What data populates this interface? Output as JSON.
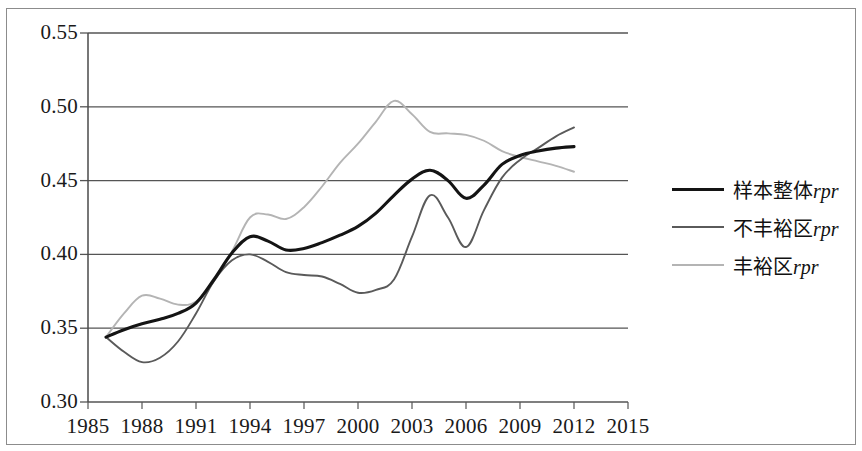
{
  "chart_data": {
    "type": "line",
    "title": "",
    "xlabel": "",
    "ylabel": "",
    "xlim": [
      1985,
      2015
    ],
    "ylim": [
      0.3,
      0.55
    ],
    "grid": true,
    "legend_position": "right",
    "x_ticks": [
      "1985",
      "1988",
      "1991",
      "1994",
      "1997",
      "2000",
      "2003",
      "2006",
      "2009",
      "2012",
      "2015"
    ],
    "y_ticks": [
      "0.55",
      "0.50",
      "0.45",
      "0.40",
      "0.35",
      "0.30"
    ],
    "x": [
      1986,
      1987,
      1988,
      1989,
      1990,
      1991,
      1992,
      1993,
      1994,
      1995,
      1996,
      1997,
      1998,
      1999,
      2000,
      2001,
      2002,
      2003,
      2004,
      2005,
      2006,
      2007,
      2008,
      2009,
      2010,
      2011,
      2012
    ],
    "series": [
      {
        "name": "样本整体rpr",
        "color": "#141414",
        "width": 3.1,
        "values": [
          0.344,
          0.349,
          0.353,
          0.356,
          0.36,
          0.367,
          0.383,
          0.401,
          0.412,
          0.409,
          0.403,
          0.404,
          0.408,
          0.413,
          0.419,
          0.428,
          0.44,
          0.451,
          0.457,
          0.45,
          0.438,
          0.447,
          0.461,
          0.467,
          0.47,
          0.472,
          0.473
        ]
      },
      {
        "name": "不丰裕区rpr",
        "color": "#5a5a5a",
        "width": 1.9,
        "values": [
          0.344,
          0.334,
          0.327,
          0.33,
          0.341,
          0.36,
          0.382,
          0.396,
          0.4,
          0.395,
          0.388,
          0.386,
          0.385,
          0.38,
          0.374,
          0.376,
          0.383,
          0.412,
          0.44,
          0.425,
          0.405,
          0.43,
          0.452,
          0.464,
          0.472,
          0.48,
          0.486
        ]
      },
      {
        "name": "丰裕区rpr",
        "color": "#b4b4b4",
        "width": 1.9,
        "values": [
          0.344,
          0.36,
          0.372,
          0.37,
          0.366,
          0.368,
          0.382,
          0.402,
          0.425,
          0.427,
          0.424,
          0.432,
          0.446,
          0.462,
          0.475,
          0.49,
          0.504,
          0.495,
          0.483,
          0.482,
          0.481,
          0.477,
          0.47,
          0.466,
          0.463,
          0.46,
          0.456
        ]
      }
    ]
  },
  "legend": {
    "items": [
      {
        "label_cn": "样本整体",
        "label_it": "rpr",
        "color": "#141414",
        "width": 3.4
      },
      {
        "label_cn": "不丰裕区",
        "label_it": "rpr",
        "color": "#5a5a5a",
        "width": 2.0
      },
      {
        "label_cn": "丰裕区",
        "label_it": "rpr",
        "color": "#b4b4b4",
        "width": 2.0
      }
    ]
  },
  "axes": {
    "y_tick_labels": [
      "0.55",
      "0.50",
      "0.45",
      "0.40",
      "0.35",
      "0.30"
    ],
    "x_tick_labels": [
      "1985",
      "1988",
      "1991",
      "1994",
      "1997",
      "2000",
      "2003",
      "2006",
      "2009",
      "2012",
      "2015"
    ]
  }
}
